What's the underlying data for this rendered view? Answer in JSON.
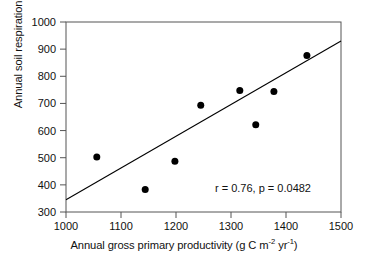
{
  "chart_data": {
    "type": "scatter",
    "title": "",
    "xlabel": "Annual gross primary productivity (g C m-2 yr-1)",
    "ylabel": "Annual soil respiration (g C m-2 yr-1)",
    "xlabel_parts": {
      "pre": "Annual gross primary productivity (g C m",
      "sup1": "-2",
      "mid": " yr",
      "sup2": "-1",
      "post": ")"
    },
    "ylabel_parts": {
      "pre": "Annual soil respiration (g C m",
      "sup1": "-2",
      "mid": " yr",
      "sup2": "-1",
      "post": ")"
    },
    "xlim": [
      1000,
      1500
    ],
    "ylim": [
      300,
      1000
    ],
    "xticks": [
      1000,
      1100,
      1200,
      1300,
      1400,
      1500
    ],
    "yticks": [
      300,
      400,
      500,
      600,
      700,
      800,
      900,
      1000
    ],
    "xtick_labels": [
      "1000",
      "1100",
      "1200",
      "1300",
      "1400",
      "1500"
    ],
    "ytick_labels": [
      "300",
      "400",
      "500",
      "600",
      "700",
      "800",
      "900",
      "1000"
    ],
    "grid": false,
    "legend": null,
    "marker": {
      "shape": "circle",
      "color": "#000000",
      "size_px": 7
    },
    "points": [
      {
        "x": 1056,
        "y": 503
      },
      {
        "x": 1144,
        "y": 383
      },
      {
        "x": 1198,
        "y": 487
      },
      {
        "x": 1245,
        "y": 693
      },
      {
        "x": 1316,
        "y": 748
      },
      {
        "x": 1345,
        "y": 621
      },
      {
        "x": 1378,
        "y": 744
      },
      {
        "x": 1438,
        "y": 877
      }
    ],
    "series": [
      {
        "name": "observations",
        "x": [
          1056,
          1144,
          1198,
          1245,
          1316,
          1345,
          1378,
          1438
        ],
        "values": [
          503,
          383,
          487,
          693,
          748,
          621,
          744,
          877
        ]
      }
    ],
    "trendline": {
      "type": "linear-fit",
      "color": "#000000",
      "x_start": 1000,
      "y_start": 345,
      "x_end": 1500,
      "y_end": 930
    },
    "annotations": [
      {
        "name": "correlation-stats",
        "text": "r = 0.76, p = 0.0482",
        "x": 1310,
        "y": 420
      }
    ],
    "axis_color": "#444444",
    "background": "#ffffff"
  }
}
